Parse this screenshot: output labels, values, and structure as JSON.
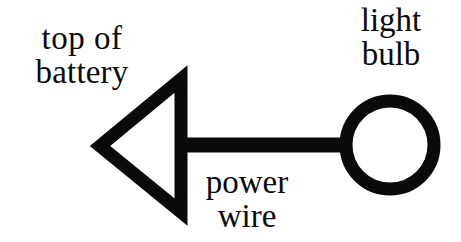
{
  "document": {
    "kind": "hand-drawn circuit diagram",
    "background_color": "#ffffff",
    "ink_color": "#0a0a0a"
  },
  "labels": {
    "battery": {
      "line_1": "top of",
      "line_2": "battery"
    },
    "bulb": {
      "line_1": "light",
      "line_2": "bulb"
    },
    "wire": {
      "line_1": "power",
      "line_2": "wire"
    }
  },
  "shapes": {
    "triangle": {
      "name": "top-of-battery-triangle",
      "description": "hollow left-pointing triangle outline",
      "points": "100,146 181,79 181,212",
      "stroke_width": 13,
      "color": "#0a0a0a"
    },
    "wire": {
      "name": "power-wire-bar",
      "description": "thick horizontal bar connecting triangle to bulb",
      "x1": 176,
      "y1": 145,
      "x2": 348,
      "y2": 145,
      "stroke_width": 15,
      "color": "#0a0a0a"
    },
    "bulb": {
      "name": "light-bulb-ring",
      "description": "thick circular ring",
      "cx": 390,
      "cy": 145,
      "r": 44,
      "stroke_width": 13,
      "color": "#0a0a0a"
    }
  }
}
